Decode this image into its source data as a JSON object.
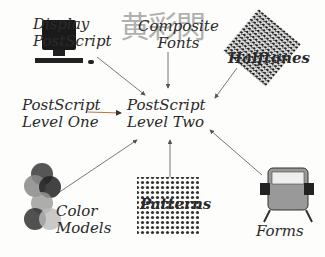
{
  "diagram": {
    "center": {
      "line1": "PostScript",
      "line2": "Level Two"
    },
    "nodes": [
      {
        "id": "display",
        "line1": "Display",
        "line2": "PostScript",
        "icon": "computer-icon"
      },
      {
        "id": "composite",
        "line1": "Composite",
        "line2": "Fonts",
        "icon": "cjk-glyphs",
        "glyphs": "黄彩閃"
      },
      {
        "id": "halftones",
        "line1": "Halftones",
        "icon": "halftone-texture-icon"
      },
      {
        "id": "level1",
        "line1": "PostScript",
        "line2": "Level One"
      },
      {
        "id": "color",
        "line1": "Color",
        "line2": "Models",
        "icon": "color-circles-icon"
      },
      {
        "id": "patterns",
        "line1": "Patterns",
        "icon": "dot-pattern-icon"
      },
      {
        "id": "forms",
        "line1": "Forms",
        "icon": "rolodex-icon"
      }
    ],
    "colors": {
      "arrow": "#555555",
      "level1_arrow": "#c0704a",
      "text": "#2a2a2a"
    }
  }
}
